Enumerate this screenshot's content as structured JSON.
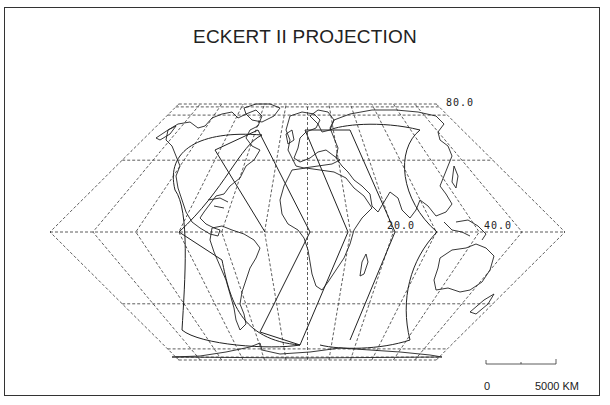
{
  "map": {
    "title": "ECKERT II PROJECTION",
    "projection": "Eckert II",
    "graticule": {
      "meridian_step_deg": 30,
      "parallels_deg": [
        -90,
        -80,
        -70,
        -40,
        0,
        40,
        70,
        80,
        90
      ],
      "style": "dashed"
    },
    "labels": [
      {
        "text": "80.0",
        "x": 446,
        "y": 97
      },
      {
        "text": "20.0",
        "x": 387,
        "y": 220
      },
      {
        "text": "40.0",
        "x": 484,
        "y": 220
      }
    ],
    "scale_bar": {
      "start_label": "0",
      "end_label": "5000 KM"
    },
    "colors": {
      "line": "#222222",
      "grid": "#333333",
      "background": "#ffffff"
    }
  }
}
